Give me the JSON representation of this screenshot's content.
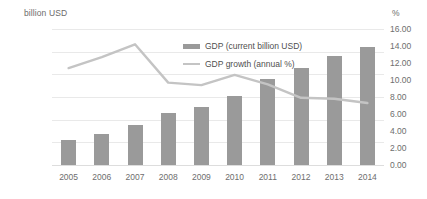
{
  "chart_data": {
    "type": "bar",
    "title": "",
    "subtitle": "",
    "xlabel": "",
    "ylabel": "billion USD",
    "y2label": "%",
    "categories": [
      "2005",
      "2006",
      "2007",
      "2008",
      "2009",
      "2010",
      "2011",
      "2012",
      "2013",
      "2014"
    ],
    "ylim": [
      0,
      12000
    ],
    "y2lim": [
      0,
      16
    ],
    "yticks": [
      "0.00",
      "2000.00",
      "4000.00",
      "6000.00",
      "8000.00",
      "10000.00",
      "12000.00"
    ],
    "ytick_values": [
      0,
      2000,
      4000,
      6000,
      8000,
      10000,
      12000
    ],
    "y2ticks": [
      "0.00",
      "2.00",
      "4.00",
      "6.00",
      "8.00",
      "10.00",
      "12.00",
      "14.00",
      "16.00"
    ],
    "y2tick_values": [
      0,
      2,
      4,
      6,
      8,
      10,
      12,
      14,
      16
    ],
    "grid": true,
    "legend_position": "inside-top-center",
    "series": [
      {
        "name": "GDP (current billion USD)",
        "type": "bar",
        "axis": "left",
        "color": "#9a9a9a",
        "values": [
          2200,
          2750,
          3550,
          4600,
          5100,
          6100,
          7550,
          8550,
          9600,
          10400
        ]
      },
      {
        "name": "GDP growth (annual %)",
        "type": "line",
        "axis": "right",
        "color": "#c4c4c4",
        "values": [
          11.4,
          12.7,
          14.2,
          9.7,
          9.4,
          10.6,
          9.5,
          7.9,
          7.8,
          7.3
        ]
      }
    ]
  },
  "legend": {
    "items": [
      {
        "label": "GDP (current billion USD)",
        "marker": "bar-swatch"
      },
      {
        "label": "GDP growth (annual %)",
        "marker": "line-swatch"
      }
    ]
  },
  "colors": {
    "bar": "#9a9a9a",
    "line": "#c4c4c4",
    "grid": "#e9e9e9",
    "text": "#6e6e6e",
    "background": "#ffffff"
  }
}
